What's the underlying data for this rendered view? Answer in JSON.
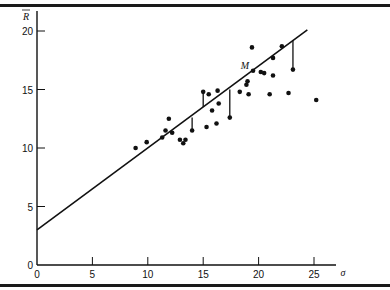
{
  "chart_data": {
    "type": "scatter",
    "title": "",
    "xlabel": "σ",
    "ylabel": "R̄",
    "xlim": [
      0,
      27
    ],
    "ylim": [
      0,
      21
    ],
    "grid": false,
    "legend": null,
    "x_ticks": [
      0,
      5,
      10,
      15,
      20,
      25
    ],
    "y_ticks": [
      0,
      5,
      10,
      15,
      20
    ],
    "x_tick_labels": [
      "0",
      "5",
      "10",
      "15",
      "20",
      "25"
    ],
    "y_tick_labels": [
      "0",
      "5",
      "10",
      "15",
      "20"
    ],
    "regression_line": {
      "x0": 0,
      "y0": 3.0,
      "x1": 24.4,
      "y1": 20.1,
      "slope": 0.7,
      "intercept": 3.0
    },
    "annotations": [
      {
        "text": "M",
        "x": 19.5,
        "y": 16.6
      }
    ],
    "points": [
      {
        "x": 8.9,
        "y": 10.0
      },
      {
        "x": 9.9,
        "y": 10.5
      },
      {
        "x": 11.3,
        "y": 10.9
      },
      {
        "x": 11.6,
        "y": 11.5
      },
      {
        "x": 11.9,
        "y": 12.5
      },
      {
        "x": 12.2,
        "y": 11.3
      },
      {
        "x": 12.9,
        "y": 10.7
      },
      {
        "x": 13.2,
        "y": 10.4
      },
      {
        "x": 13.4,
        "y": 10.7
      },
      {
        "x": 14.0,
        "y": 11.5
      },
      {
        "x": 15.0,
        "y": 14.8
      },
      {
        "x": 15.3,
        "y": 11.8
      },
      {
        "x": 15.5,
        "y": 14.6
      },
      {
        "x": 15.8,
        "y": 13.2
      },
      {
        "x": 16.2,
        "y": 12.1
      },
      {
        "x": 16.3,
        "y": 14.9
      },
      {
        "x": 16.4,
        "y": 13.8
      },
      {
        "x": 17.4,
        "y": 12.6
      },
      {
        "x": 18.3,
        "y": 14.8
      },
      {
        "x": 18.9,
        "y": 15.4
      },
      {
        "x": 19.0,
        "y": 15.7
      },
      {
        "x": 19.1,
        "y": 14.6
      },
      {
        "x": 19.4,
        "y": 18.6
      },
      {
        "x": 19.5,
        "y": 16.6
      },
      {
        "x": 20.2,
        "y": 16.5
      },
      {
        "x": 20.5,
        "y": 16.4
      },
      {
        "x": 21.0,
        "y": 14.6
      },
      {
        "x": 21.3,
        "y": 17.7
      },
      {
        "x": 21.3,
        "y": 16.2
      },
      {
        "x": 22.1,
        "y": 18.7
      },
      {
        "x": 22.7,
        "y": 14.7
      },
      {
        "x": 23.1,
        "y": 16.7
      },
      {
        "x": 25.2,
        "y": 14.1
      }
    ],
    "residual_segments": [
      {
        "x": 14.0,
        "y_point": 11.5,
        "y_line": 12.6
      },
      {
        "x": 15.0,
        "y_point": 14.8,
        "y_line": 13.5
      },
      {
        "x": 17.4,
        "y_point": 12.6,
        "y_line": 15.0
      },
      {
        "x": 23.1,
        "y_point": 16.7,
        "y_line": 19.2
      }
    ]
  }
}
